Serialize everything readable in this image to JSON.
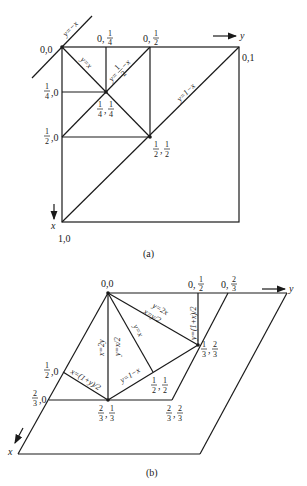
{
  "figure_a": {
    "caption": "(a)",
    "axis_y_label": "y",
    "axis_x_label": "x",
    "points": {
      "origin": "0,0",
      "p_0_quarter": {
        "prefix": "0,",
        "num": "1",
        "den": "4"
      },
      "p_0_half": {
        "prefix": "0,",
        "num": "1",
        "den": "2"
      },
      "p_0_1": "0,1",
      "p_quarter_0": {
        "num": "1",
        "den": "4",
        "suffix": ",0"
      },
      "p_half_0": {
        "num": "1",
        "den": "2",
        "suffix": ",0"
      },
      "p_quarter_quarter": {
        "n1": "1",
        "d1": "4",
        "n2": "1",
        "d2": "4"
      },
      "p_half_half": {
        "n1": "1",
        "d1": "2",
        "n2": "1",
        "d2": "2"
      },
      "p_1_0": "1,0"
    },
    "lines": {
      "y_eq_neg_x": "y=−x",
      "y_eq_x": "y=x",
      "y_eq_half_minus_x": {
        "pre": "y=",
        "num": "1",
        "den": "2",
        "post": "−x"
      },
      "y_eq_1_minus_x": "y=1−x"
    }
  },
  "figure_b": {
    "caption": "(b)",
    "axis_y_label": "y",
    "axis_x_label": "x",
    "points": {
      "origin": "0,0",
      "p_0_half": {
        "prefix": "0,",
        "num": "1",
        "den": "2"
      },
      "p_0_twothirds": {
        "prefix": "0,",
        "num": "2",
        "den": "3"
      },
      "p_half_0": {
        "num": "1",
        "den": "2",
        "suffix": ",0"
      },
      "p_twothirds_0": {
        "num": "2",
        "den": "3",
        "suffix": ",0"
      },
      "p_third_twothirds": {
        "n1": "1",
        "d1": "3",
        "n2": "2",
        "d2": "3"
      },
      "p_half_half": {
        "n1": "1",
        "d1": "2",
        "n2": "1",
        "d2": "2"
      },
      "p_twothirds_third": {
        "n1": "2",
        "d1": "3",
        "n2": "1",
        "d2": "3"
      },
      "p_twothirds_twothirds": {
        "n1": "2",
        "d1": "3",
        "n2": "2",
        "d2": "3"
      }
    },
    "lines": {
      "x_eq_2y": "x=2y",
      "y_eq_x_half": "y=x/2",
      "y_eq_x": "y=x",
      "x_eq_y_half": "x=y/2",
      "y_eq_2x": "y=2x",
      "y_eq_1plusx_half": "y=(1+x)/2",
      "x_eq_1plusy_half": "x=(1+y)/2",
      "y_eq_1_minus_x": "y=1−x"
    }
  }
}
